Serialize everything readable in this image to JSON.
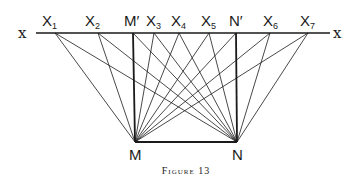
{
  "figure": {
    "caption": "Figure 13",
    "line_label_left": "x",
    "line_label_right": "x"
  },
  "points_top": [
    {
      "id": "X1",
      "base": "X",
      "sub": "1",
      "x": 55
    },
    {
      "id": "X2",
      "base": "X",
      "sub": "2",
      "x": 98
    },
    {
      "id": "M'",
      "base": "M′",
      "sub": "",
      "x": 133
    },
    {
      "id": "X3",
      "base": "X",
      "sub": "3",
      "x": 154
    },
    {
      "id": "X4",
      "base": "X",
      "sub": "4",
      "x": 179
    },
    {
      "id": "X5",
      "base": "X",
      "sub": "5",
      "x": 209
    },
    {
      "id": "N'",
      "base": "N′",
      "sub": "",
      "x": 236
    },
    {
      "id": "X6",
      "base": "X",
      "sub": "6",
      "x": 270
    },
    {
      "id": "X7",
      "base": "X",
      "sub": "7",
      "x": 308
    }
  ],
  "points_bottom": [
    {
      "id": "M",
      "label": "M",
      "x": 135,
      "y": 142
    },
    {
      "id": "N",
      "label": "N",
      "x": 237,
      "y": 142
    }
  ],
  "labels": {
    "X1": "X",
    "X1_sub": "1",
    "X2": "X",
    "X2_sub": "2",
    "Mp": "M′",
    "X3": "X",
    "X3_sub": "3",
    "X4": "X",
    "X4_sub": "4",
    "X5": "X",
    "X5_sub": "5",
    "Np": "N′",
    "X6": "X",
    "X6_sub": "6",
    "X7": "X",
    "X7_sub": "7",
    "M": "M",
    "N": "N"
  },
  "colors": {
    "ink": "#1a1a1a",
    "background": "#ffffff"
  }
}
